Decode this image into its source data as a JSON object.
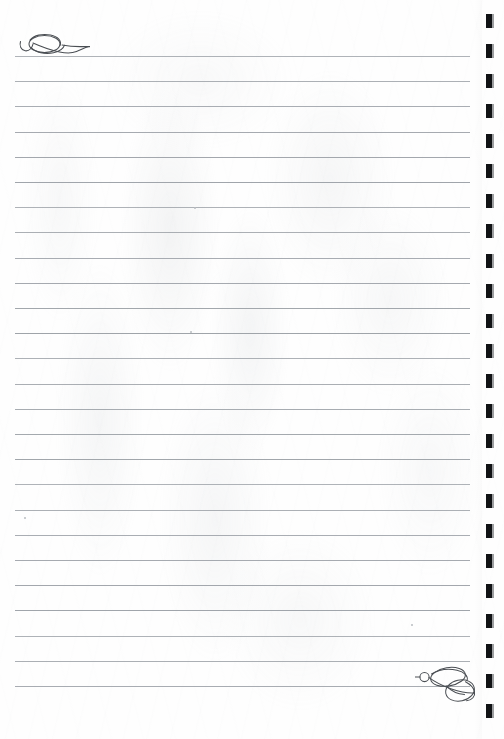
{
  "document": {
    "title": "Lined Stationery Page",
    "kind": "blank-lined-writing-paper",
    "page_width": 504,
    "page_height": 739,
    "background_color": "#fefefe",
    "rule_color": "#9ba0a6",
    "ink_color": "#4a4e53",
    "binding_mark_color": "#111315"
  },
  "ruled_lines": {
    "count": 26,
    "first_line_y": 56,
    "line_spacing": 25.2,
    "line_start_x": 15,
    "line_end_x": 470,
    "thickness_px": 1,
    "positions_y": [
      56,
      81,
      106,
      132,
      157,
      182,
      207,
      232,
      258,
      283,
      308,
      333,
      358,
      384,
      409,
      434,
      459,
      484,
      510,
      535,
      560,
      585,
      610,
      636,
      661,
      686
    ]
  },
  "flourishes": [
    {
      "name": "top-left-flourish",
      "description": "calligraphic hook and oval loop terminating into the first ruled line",
      "x": 18,
      "y": 28,
      "width": 70,
      "height": 34
    },
    {
      "name": "bottom-right-flourish",
      "description": "double overlapping loop swirl with small bead, trailing from the last ruled line",
      "x": 415,
      "y": 662,
      "width": 70,
      "height": 42
    }
  ],
  "binding_marks": {
    "name": "right-edge-binding-marks",
    "count": 24,
    "first_y": 14,
    "spacing": 30,
    "mark_width": 6,
    "mark_height": 14,
    "left_offset_x": 489
  },
  "specks": [
    {
      "x": 194,
      "y": 207,
      "size": 2
    },
    {
      "x": 190,
      "y": 331,
      "size": 2
    },
    {
      "x": 24,
      "y": 517,
      "size": 2
    },
    {
      "x": 411,
      "y": 624,
      "size": 2
    }
  ]
}
